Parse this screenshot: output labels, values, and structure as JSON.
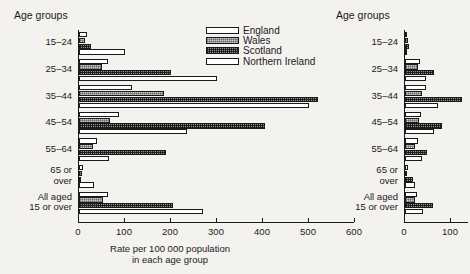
{
  "figure": {
    "background_color": "#f4f2ee",
    "ink_color": "#1a1a1a",
    "axis_title_line1": "Rate per 100 000 population",
    "axis_title_line2": "in each age group"
  },
  "legend": {
    "position": "top-center-right",
    "entries": [
      {
        "label": "England",
        "pattern": "open"
      },
      {
        "label": "Wales",
        "pattern": "light-stipple"
      },
      {
        "label": "Scotland",
        "pattern": "dark-hatch"
      },
      {
        "label": "Northern Ireland",
        "pattern": "open"
      }
    ]
  },
  "panels": {
    "left": {
      "axis_group_title": "Age groups",
      "xlim": [
        0,
        600
      ],
      "xticks": [
        0,
        100,
        200,
        300,
        400,
        500,
        600
      ],
      "xticklabels": [
        "0",
        "100",
        "200",
        "300",
        "400",
        "500",
        "600"
      ]
    },
    "right": {
      "axis_group_title": "Age groups",
      "xlim": [
        0,
        140
      ],
      "xticks": [
        0,
        100
      ],
      "xticklabels": [
        "0",
        "100"
      ]
    }
  },
  "chart_data": [
    {
      "type": "bar",
      "orientation": "horizontal",
      "panel": "left",
      "title": "",
      "xlabel": "Rate per 100 000 population in each age group",
      "ylabel": "Age groups",
      "xlim": [
        0,
        600
      ],
      "xticks": [
        0,
        100,
        200,
        300,
        400,
        500,
        600
      ],
      "grid": false,
      "legend_position": "top-right",
      "categories": [
        "15–24",
        "25–34",
        "35–44",
        "45–54",
        "55–64",
        "65 or over",
        "All aged 15 or over"
      ],
      "series": [
        {
          "name": "England",
          "values": [
            18,
            62,
            115,
            88,
            40,
            9,
            62
          ]
        },
        {
          "name": "Wales",
          "values": [
            12,
            50,
            185,
            68,
            30,
            6,
            52
          ]
        },
        {
          "name": "Scotland",
          "values": [
            26,
            200,
            520,
            405,
            190,
            5,
            205
          ]
        },
        {
          "name": "Northern Ireland",
          "values": [
            100,
            300,
            500,
            235,
            65,
            32,
            270
          ]
        }
      ]
    },
    {
      "type": "bar",
      "orientation": "horizontal",
      "panel": "right",
      "title": "",
      "xlabel": "",
      "ylabel": "Age groups",
      "xlim": [
        0,
        140
      ],
      "xticks": [
        0,
        100
      ],
      "grid": false,
      "categories": [
        "15–24",
        "25–34",
        "35–44",
        "45–54",
        "55–64",
        "65 or over",
        "All aged 15 or over"
      ],
      "series": [
        {
          "name": "England",
          "values": [
            4,
            33,
            45,
            34,
            28,
            7,
            26
          ]
        },
        {
          "name": "Wales",
          "values": [
            6,
            28,
            38,
            30,
            22,
            5,
            22
          ]
        },
        {
          "name": "Scotland",
          "values": [
            8,
            64,
            124,
            80,
            48,
            18,
            60
          ]
        },
        {
          "name": "Northern Ireland",
          "values": [
            2,
            46,
            72,
            64,
            38,
            22,
            40
          ]
        }
      ]
    }
  ],
  "labels": {
    "left_groups": [
      "15–24",
      "25–34",
      "35–44",
      "45–54",
      "55–64",
      "65 or\nover",
      "All aged\n15 or over"
    ],
    "right_groups": [
      "15–24",
      "25–34",
      "35–44",
      "45–54",
      "55–64",
      "65 or\nover",
      "All aged\n15 or over"
    ]
  }
}
